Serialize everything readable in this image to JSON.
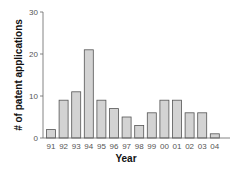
{
  "chart_data": {
    "type": "bar",
    "title": "",
    "xlabel": "Year",
    "ylabel": "# of patent applications",
    "categories": [
      "91",
      "92",
      "93",
      "94",
      "95",
      "96",
      "97",
      "98",
      "99",
      "00",
      "01",
      "02",
      "03",
      "04"
    ],
    "values": [
      2,
      9,
      11,
      21,
      9,
      7,
      5,
      3,
      6,
      9,
      9,
      6,
      6,
      1
    ],
    "ylim": [
      0,
      30
    ],
    "yticks": [
      0,
      10,
      20,
      30
    ],
    "grid": false,
    "legend": null,
    "bar_color": "#d3d3d3",
    "bar_edge_color": "#555555"
  }
}
